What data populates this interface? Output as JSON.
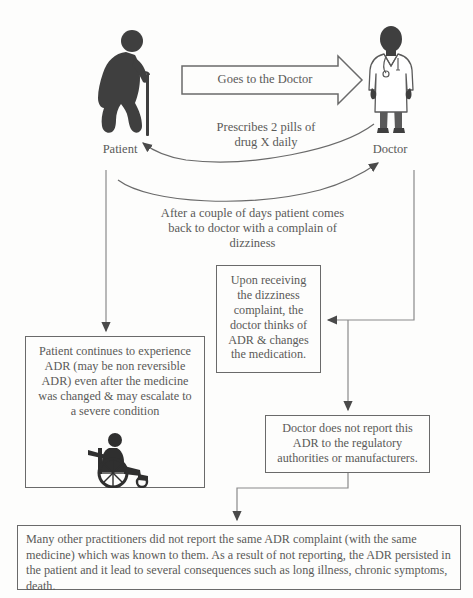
{
  "diagram": {
    "actors": {
      "patient_label": "Patient",
      "doctor_label": "Doctor"
    },
    "edges": {
      "goes_to_doctor": "Goes to the Doctor",
      "prescribes": "Prescribes 2 pills of\ndrug X daily",
      "comes_back": "After a couple of days patient comes\nback to doctor with a complain of\ndizziness"
    },
    "boxes": {
      "upon_receiving": "Upon receiving\nthe dizziness\ncomplaint, the\ndoctor thinks of\nADR & changes\nthe medication.",
      "patient_continues": "Patient continues to experience\nADR (may be non reversible\nADR) even after the medicine\nwas changed & may escalate to\na severe condition",
      "no_report": "Doctor does not report this\nADR to the regulatory\nauthorities or manufacturers.",
      "many_others": "Many other practitioners did not report the same ADR complaint (with the same medicine) which was known to them.   As a result of not reporting, the ADR persisted in the patient and it lead to several consequences such as long illness, chronic symptoms, death."
    },
    "icons": {
      "patient": "elderly-person-with-cane-icon",
      "doctor": "doctor-in-white-coat-icon",
      "wheelchair": "person-in-wheelchair-icon"
    },
    "colors": {
      "figure_fill": "#3f3f3f",
      "line": "#6a6a6a",
      "text": "#5a5a58",
      "background": "#fdfdfc"
    }
  }
}
